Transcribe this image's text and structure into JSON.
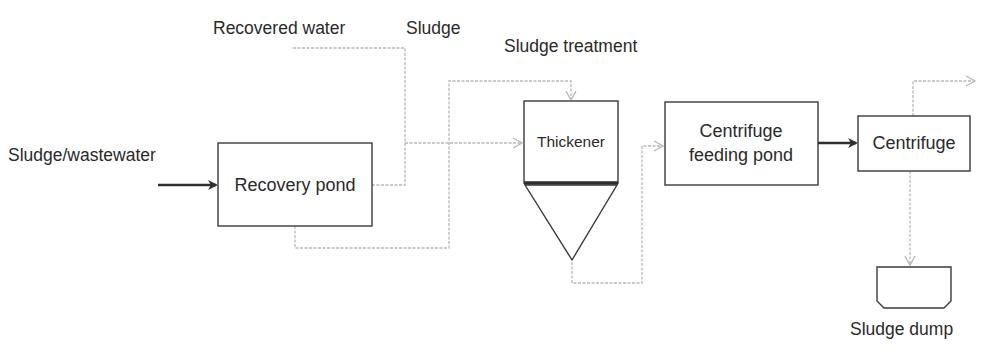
{
  "title": "Sludge treatment",
  "labels": {
    "recovered_water": "Recovered water",
    "sludge": "Sludge",
    "sludge_treatment": "Sludge treatment",
    "input": "Sludge/wastewater",
    "sludge_dump": "Sludge dump"
  },
  "nodes": {
    "recovery_pond": "Recovery pond",
    "thickener": "Thickener",
    "centrifuge_feeding_pond_line1": "Centrifuge",
    "centrifuge_feeding_pond_line2": "feeding pond",
    "centrifuge": "Centrifuge"
  },
  "colors": {
    "box_stroke": "#3a3a3a",
    "primary_flow": "#2e2e2e",
    "secondary_flow": "#b8b8b8",
    "text": "#2a2a2a"
  }
}
